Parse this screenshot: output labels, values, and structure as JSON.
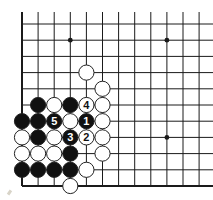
{
  "diagram": {
    "type": "go-board-corner",
    "corner": "bottom-left",
    "grid": {
      "origin_x": 22,
      "origin_y": 24,
      "spacing_x": 16.1,
      "spacing_y": 16.2,
      "cols": 13,
      "rows": 11,
      "top_extend": 12,
      "right_extend": 213
    },
    "colors": {
      "line": "#1a1a1a",
      "black_stone": "#111111",
      "white_stone": "#ffffff",
      "stone_outline": "#222222",
      "label_on_black": "#ffffff",
      "label_on_white": "#111111"
    },
    "star_points": [
      [
        3,
        1
      ],
      [
        9,
        1
      ],
      [
        9,
        7
      ]
    ],
    "stones": [
      {
        "color": "white",
        "col": 4,
        "row": 3
      },
      {
        "color": "white",
        "col": 5,
        "row": 4
      },
      {
        "color": "black",
        "col": 1,
        "row": 5
      },
      {
        "color": "white",
        "col": 2,
        "row": 5
      },
      {
        "color": "black",
        "col": 3,
        "row": 5
      },
      {
        "color": "white",
        "col": 4,
        "row": 5,
        "label": "4"
      },
      {
        "color": "white",
        "col": 5,
        "row": 5
      },
      {
        "color": "black",
        "col": 0,
        "row": 6
      },
      {
        "color": "black",
        "col": 1,
        "row": 6
      },
      {
        "color": "black",
        "col": 2,
        "row": 6,
        "label": "5"
      },
      {
        "color": "white",
        "col": 3,
        "row": 6
      },
      {
        "color": "black",
        "col": 4,
        "row": 6,
        "label": "1"
      },
      {
        "color": "white",
        "col": 5,
        "row": 6
      },
      {
        "color": "white",
        "col": 0,
        "row": 7
      },
      {
        "color": "black",
        "col": 1,
        "row": 7
      },
      {
        "color": "white",
        "col": 2,
        "row": 7
      },
      {
        "color": "black",
        "col": 3,
        "row": 7,
        "label": "3"
      },
      {
        "color": "white",
        "col": 4,
        "row": 7,
        "label": "2"
      },
      {
        "color": "white",
        "col": 5,
        "row": 7
      },
      {
        "color": "white",
        "col": 0,
        "row": 8
      },
      {
        "color": "white",
        "col": 1,
        "row": 8
      },
      {
        "color": "white",
        "col": 2,
        "row": 8
      },
      {
        "color": "black",
        "col": 3,
        "row": 8
      },
      {
        "color": "white",
        "col": 5,
        "row": 8
      },
      {
        "color": "black",
        "col": 0,
        "row": 9
      },
      {
        "color": "black",
        "col": 1,
        "row": 9
      },
      {
        "color": "black",
        "col": 2,
        "row": 9
      },
      {
        "color": "black",
        "col": 3,
        "row": 9
      },
      {
        "color": "white",
        "col": 4,
        "row": 9
      },
      {
        "color": "white",
        "col": 3,
        "row": 10
      }
    ],
    "move_labels": [
      "1",
      "2",
      "3",
      "4",
      "5"
    ]
  }
}
